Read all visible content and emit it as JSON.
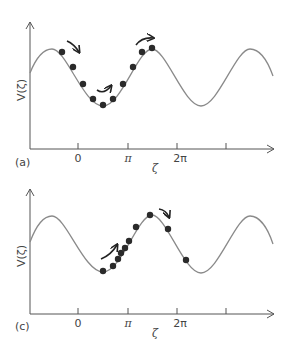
{
  "panels": [
    {
      "id": "a",
      "label": "(a)",
      "y_axis_label": "V(ζ)",
      "x_axis_label": "ζ",
      "x_ticks": [
        "0",
        "π",
        "2π",
        ""
      ],
      "description": "Cluster of points spread across a potential well, moving from left peak down into trough and up to right peak",
      "point_count": 10
    },
    {
      "id": "c",
      "label": "(c)",
      "y_axis_label": "V(ζ)",
      "x_axis_label": "ζ",
      "x_ticks": [
        "0",
        "π",
        "2π",
        ""
      ],
      "description": "Points bunched on rising slope near π, spreading over the peak and down the other side",
      "point_count": 10
    }
  ],
  "colors": {
    "curve": "#8a8a8a",
    "dots": "#2a2a2a",
    "axes": "#555555",
    "arrows": "#222222"
  }
}
